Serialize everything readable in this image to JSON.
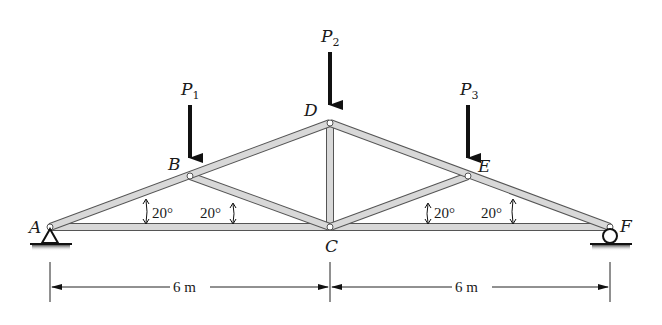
{
  "diagram": {
    "type": "truss",
    "colors": {
      "member_fill": "#d9d9d9",
      "member_edge": "#555555",
      "load_arrow": "#111111",
      "ground_shade": "#777777",
      "text": "#1a1a1a"
    },
    "joints": {
      "A": {
        "label": "A",
        "x": 50,
        "y": 227
      },
      "B": {
        "label": "B",
        "x": 190,
        "y": 176
      },
      "C": {
        "label": "C",
        "x": 330,
        "y": 227
      },
      "D": {
        "label": "D",
        "x": 330,
        "y": 123
      },
      "E": {
        "label": "E",
        "x": 468,
        "y": 176
      },
      "F": {
        "label": "F",
        "x": 610,
        "y": 227
      }
    },
    "members": [
      "AB",
      "BD",
      "DE",
      "EF",
      "AC",
      "CF",
      "BC",
      "CD",
      "CE"
    ],
    "loads": [
      {
        "name": "P",
        "sub": "1",
        "joint": "B"
      },
      {
        "name": "P",
        "sub": "2",
        "joint": "D"
      },
      {
        "name": "P",
        "sub": "3",
        "joint": "E"
      }
    ],
    "supports": {
      "A": "pin",
      "F": "roller"
    },
    "angles": [
      {
        "label": "20°",
        "location": "A-B chord"
      },
      {
        "label": "20°",
        "location": "B-C web"
      },
      {
        "label": "20°",
        "location": "C-E web"
      },
      {
        "label": "20°",
        "location": "E-F chord"
      }
    ],
    "dimensions": [
      {
        "label": "6 m",
        "from": "A",
        "to": "C"
      },
      {
        "label": "6 m",
        "from": "C",
        "to": "F"
      }
    ]
  }
}
